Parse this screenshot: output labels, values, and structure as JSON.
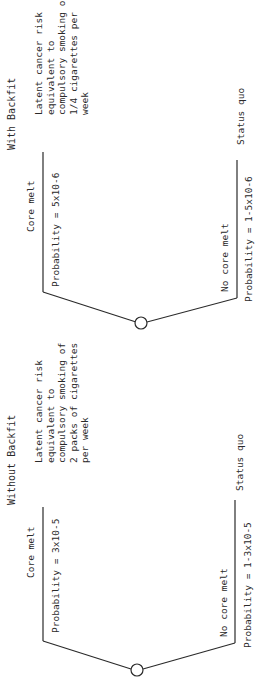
{
  "trees": [
    {
      "title": "With Backfit",
      "core_melt": {
        "label": "Core melt",
        "probability": "Probability = 5x10-6",
        "outcome": [
          "Latent cancer risk",
          "equivalent to",
          "compulsory smoking of",
          "1/4 cigarettes per",
          "week"
        ]
      },
      "no_core_melt": {
        "label": "No core melt",
        "probability": "Probability = 1-5x10-6",
        "outcome": "Status quo"
      }
    },
    {
      "title": "Without Backfit",
      "core_melt": {
        "label": "Core melt",
        "probability": "Probability = 3x10-5",
        "outcome": [
          "Latent cancer risk",
          "equivalent to",
          "compulsory smoking of",
          "2 packs of cigarettes",
          "per week"
        ]
      },
      "no_core_melt": {
        "label": "No core melt",
        "probability": "Probability = 1-3x10-5",
        "outcome": "Status quo"
      }
    }
  ],
  "colors": {
    "ink": "#2a2a2a",
    "background": "#ffffff"
  }
}
